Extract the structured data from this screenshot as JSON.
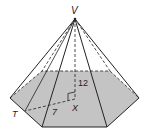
{
  "diagram": {
    "type": "hexagonal-pyramid",
    "labels": {
      "apex": "V",
      "base_point": "T",
      "center": "X",
      "height": "12",
      "apothem": "7"
    },
    "colors": {
      "base_fill": "#c4c4c4",
      "line": "#222222",
      "background": "#ffffff"
    }
  }
}
